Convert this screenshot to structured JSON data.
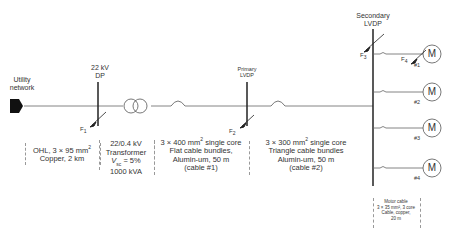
{
  "diagram": {
    "colors": {
      "line": "#555555",
      "bus": "#222222",
      "text": "#333333",
      "dashed": "#999999"
    },
    "source": {
      "label_line1": "Utility",
      "label_line2": "network",
      "icon": "arrow-right-icon"
    },
    "buses": {
      "dp": {
        "label_line1": "22 kV",
        "label_line2": "DP"
      },
      "primary_lvdp": {
        "label_line1": "Primary",
        "label_line2": "LVDP"
      },
      "secondary_lvdp": {
        "label_line1": "Secondary",
        "label_line2": "LVDP"
      }
    },
    "faults": {
      "f1": {
        "label": "F",
        "sub": "1"
      },
      "f2": {
        "label": "F",
        "sub": "2"
      },
      "f3": {
        "label": "F",
        "sub": "3"
      },
      "f4": {
        "label": "F",
        "sub": "4"
      }
    },
    "sections": {
      "ohl": {
        "line1": "OHL, 3 × 95 mm",
        "line1_sup": "2",
        "line2": "Copper, 2 km"
      },
      "transformer": {
        "line1": "22/0.4 kV",
        "line2": "Transformer",
        "line3_v": "V",
        "line3_sub": "sc",
        "line3_rest": " = 5%",
        "line4": "1000 kVA"
      },
      "cable1": {
        "line1": "3 × 400 mm",
        "line1_sup": "2",
        "line1_rest": " single core",
        "line2": "Flat cable bundles,",
        "line3": "Alumin-um, 50 m",
        "line4": "(cable #1)"
      },
      "cable2": {
        "line1": "3 × 300 mm",
        "line1_sup": "2",
        "line1_rest": " single core",
        "line2": "Triangle cable bundles",
        "line3": "Alumin-um, 50 m",
        "line4": "(cable #2)"
      },
      "motor_cable": {
        "line1": "Motor cable",
        "line2": "3 × 35 mm², 3 core",
        "line3": "Cable, copper,",
        "line4": "20 m"
      }
    },
    "motors": [
      {
        "symbol": "M",
        "label": "#1"
      },
      {
        "symbol": "M",
        "label": "#2"
      },
      {
        "symbol": "M",
        "label": "#3"
      },
      {
        "symbol": "M",
        "label": "#4"
      }
    ]
  }
}
